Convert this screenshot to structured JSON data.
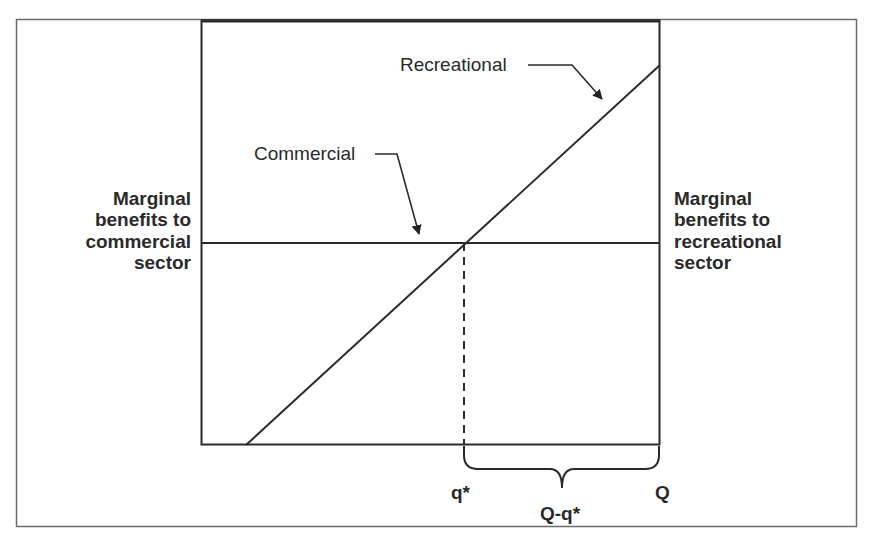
{
  "diagram": {
    "title": "",
    "curves": {
      "recreational_label": "Recreational",
      "commercial_label": "Commercial"
    },
    "axes": {
      "left_label_line1": "Marginal",
      "left_label_line2": "benefits to",
      "left_label_line3": "commercial",
      "left_label_line4": "sector",
      "right_label_line1": "Marginal",
      "right_label_line2": "benefits to",
      "right_label_line3": "recreational",
      "right_label_line4": "sector"
    },
    "x_markers": {
      "q_star": "q*",
      "Q": "Q",
      "brace_label": "Q-q*"
    },
    "colors": {
      "line": "#2a2a2a",
      "frame": "#6a6a6a",
      "background": "#ffffff"
    }
  }
}
